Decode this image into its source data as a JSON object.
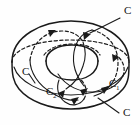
{
  "figure": {
    "kind": "line-drawing",
    "background_color": "#fefefe",
    "ink_color": "#1a1a1a",
    "shape": "torus",
    "labels": [
      {
        "id": "label-c-top-right",
        "text": "C",
        "sub": "",
        "x": 124,
        "y": 14
      },
      {
        "id": "label-c-left",
        "text": "C",
        "sub": "",
        "x": 22,
        "y": 75
      },
      {
        "id": "label-c1-right",
        "text": "C",
        "sub": "1",
        "x": 109,
        "y": 87
      },
      {
        "id": "label-c2-bottom-left",
        "text": "C",
        "sub": "2",
        "x": 46,
        "y": 95
      },
      {
        "id": "label-c-bottom-right",
        "text": "C",
        "sub": "",
        "x": 123,
        "y": 116
      }
    ],
    "legend": {
      "solid": "visible contour",
      "dashed": "hidden contour"
    }
  }
}
